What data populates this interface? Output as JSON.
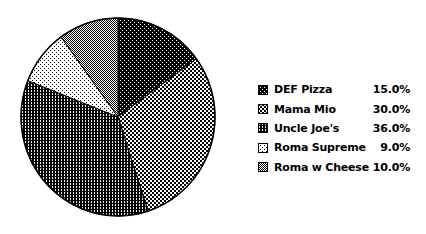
{
  "chart_data": {
    "type": "pie",
    "title": "",
    "categories": [
      "DEF Pizza",
      "Mama Mio",
      "Uncle Joe's",
      "Roma Supreme",
      "Roma w Cheese"
    ],
    "values": [
      15.0,
      30.0,
      36.0,
      9.0,
      10.0
    ],
    "value_labels": [
      "15.0%",
      "30.0%",
      "36.0%",
      "9.0%",
      "10.0%"
    ],
    "units": "percent",
    "start_angle_deg": 0,
    "direction": "clockwise",
    "legend_position": "right",
    "patterns": [
      "black-with-white-dots",
      "coarse-black-white-checker",
      "black-with-white-dashes",
      "white-with-black-dots",
      "fine-50pct-gray-checker"
    ],
    "colors": {
      "foreground": "#000000",
      "background": "#ffffff"
    }
  }
}
